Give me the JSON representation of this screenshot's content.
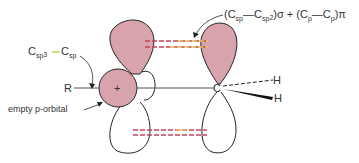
{
  "labels": {
    "top_right": {
      "open": "(C",
      "sub1": "sp",
      "dash": "—C",
      "sub2": "sp",
      "sup2": "2",
      "mid": ")σ + (C",
      "sub3": "p",
      "dash2": "—C",
      "sub4": "p",
      "close": ")π"
    },
    "left_bond": {
      "c1": "C",
      "c1_sub": "sp",
      "c1_sup": "3",
      "c2": "C",
      "c2_sub": "sp"
    },
    "r_group": "R",
    "plus_sign": "+",
    "carbon": "C",
    "h_top": "H",
    "h_bottom": "H",
    "empty_orbital": "empty p-orbital"
  },
  "colors": {
    "lobe_fill": "#d9a3ad",
    "outline": "#222222",
    "overlap_red": "#c8405a",
    "overlap_yellow": "#e0c860",
    "label_bond_green": "#b8c838",
    "text": "#333333"
  }
}
